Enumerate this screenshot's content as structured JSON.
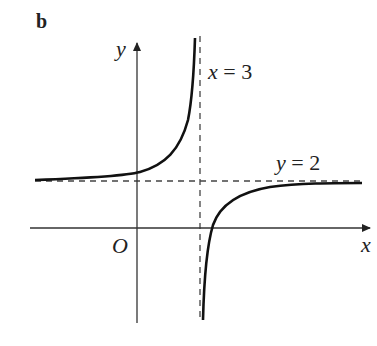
{
  "panel_label": "b",
  "axes": {
    "x_label": "x",
    "y_label": "y",
    "origin_label": "O"
  },
  "asymptotes": {
    "vertical": {
      "label": "x = 3",
      "value": 3
    },
    "horizontal": {
      "label": "y = 2",
      "value": 2
    }
  },
  "colors": {
    "curve": "#111111",
    "axis": "#333333",
    "dashed": "#444444",
    "text": "#222222"
  },
  "curve": {
    "type": "rectangular hyperbola",
    "branches": [
      "upper-left (x<3, y>2)",
      "lower-right (x>3, y<2)"
    ]
  }
}
